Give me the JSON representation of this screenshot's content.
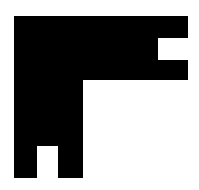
{
  "figure": {
    "foreground": "#000000",
    "background": "#ffffff"
  }
}
